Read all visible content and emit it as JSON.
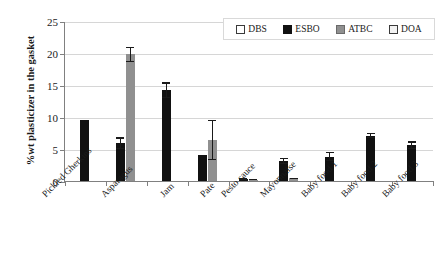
{
  "chart_data": {
    "type": "bar",
    "title": "",
    "xlabel": "",
    "ylabel": "%wt plasticizer in the gasket",
    "ylim": [
      0,
      25
    ],
    "yticks": [
      0,
      5,
      10,
      15,
      20,
      25
    ],
    "grid": true,
    "legend_position": "top-right",
    "categories": [
      "Pickled Gherkins",
      "Asparagus",
      "Jam",
      "Pate",
      "Pesto sauce",
      "Mayonnaise",
      "Baby food 1",
      "Baby food 2",
      "Baby food 3"
    ],
    "series": [
      {
        "name": "DBS",
        "color": "#ffffff",
        "values": [
          null,
          null,
          null,
          null,
          null,
          null,
          null,
          null,
          null
        ],
        "errors": [
          null,
          null,
          null,
          null,
          null,
          null,
          null,
          null,
          null
        ]
      },
      {
        "name": "ESBO",
        "color": "#111111",
        "values": [
          9.6,
          5.9,
          14.2,
          4.1,
          0.3,
          3.1,
          3.8,
          7.1,
          5.6
        ],
        "errors": [
          0.0,
          0.9,
          1.2,
          0.0,
          0.1,
          0.5,
          0.7,
          0.4,
          0.6
        ]
      },
      {
        "name": "ATBC",
        "color": "#909090",
        "values": [
          null,
          19.8,
          null,
          6.4,
          0.2,
          0.4,
          null,
          null,
          null
        ],
        "errors": [
          null,
          1.2,
          null,
          3.1,
          0.1,
          0.1,
          null,
          null,
          null
        ]
      },
      {
        "name": "DOA",
        "color": "#f2f2f2",
        "values": [
          null,
          null,
          null,
          null,
          null,
          null,
          null,
          null,
          null
        ],
        "errors": [
          null,
          null,
          null,
          null,
          null,
          null,
          null,
          null,
          null
        ]
      }
    ]
  },
  "legend": {
    "entries": [
      {
        "label": "DBS"
      },
      {
        "label": "ESBO"
      },
      {
        "label": "ATBC"
      },
      {
        "label": "DOA"
      }
    ]
  },
  "axis": {
    "y_title": "%wt plasticizer in the gasket",
    "y_tick_labels": [
      "0",
      "5",
      "10",
      "15",
      "20",
      "25"
    ]
  }
}
